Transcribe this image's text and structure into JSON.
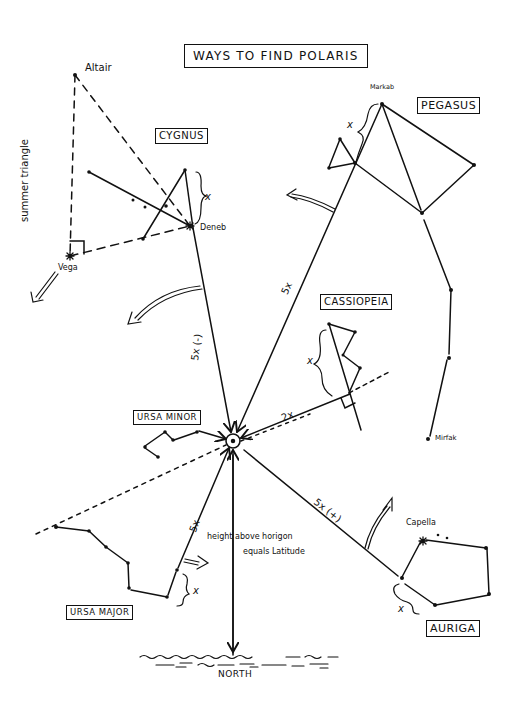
{
  "title": "WAYS TO FIND POLARIS",
  "constellations": {
    "cygnus": "CYGNUS",
    "pegasus": "PEGASUS",
    "cassiopeia": "CASSIOPEIA",
    "ursa_minor": "URSA MINOR",
    "ursa_major": "URSA MAJOR",
    "auriga": "AURIGA"
  },
  "stars": {
    "altair": "Altair",
    "deneb": "Deneb",
    "vega": "Vega",
    "markab": "Markab",
    "mirfak": "Mirfak",
    "capella": "Capella"
  },
  "annotations": {
    "summer_triangle": "summer triangle",
    "cygnus_distance": "5x (-)",
    "pegasus_distance": "5x",
    "cassiopeia_distance": "2x",
    "ursa_major_distance": "5x",
    "auriga_distance": "5x (+)",
    "x_cygnus": "x",
    "x_pegasus": "x",
    "x_cassiopeia": "x",
    "x_ursa_major": "x",
    "x_auriga": "x",
    "height_line1": "height above horigon",
    "height_line2": "equals Latitude",
    "north": "NORTH"
  },
  "colors": {
    "ink": "#111111",
    "paper": "#ffffff"
  }
}
